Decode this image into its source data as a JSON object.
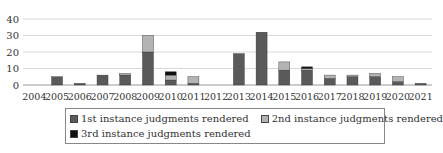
{
  "chart_data": {
    "type": "bar",
    "stacked": true,
    "title": "",
    "xlabel": "",
    "ylabel": "",
    "ylim": [
      0,
      40
    ],
    "yticks": [
      0,
      10,
      20,
      30,
      40
    ],
    "grid": true,
    "legend_position": "bottom",
    "categories": [
      "2004",
      "2005",
      "2006",
      "2007",
      "2008",
      "2009",
      "2010",
      "2011",
      "2012",
      "2013",
      "2014",
      "2015",
      "2016",
      "2017",
      "2018",
      "2019",
      "2020",
      "2021"
    ],
    "series": [
      {
        "name": "1st instance judgments rendered",
        "color": "#5a5a5a",
        "values": [
          0,
          5,
          1,
          6,
          6,
          20,
          3,
          1,
          0,
          19,
          32,
          9,
          9,
          4,
          5,
          5,
          2,
          1
        ]
      },
      {
        "name": "2nd instance judgments rendered",
        "color": "#b3b3b3",
        "values": [
          0,
          0,
          0,
          0,
          1,
          10,
          3,
          4,
          0,
          0,
          0,
          5,
          1,
          2,
          1,
          2,
          3,
          0
        ]
      },
      {
        "name": "3rd instance judgments rendered",
        "color": "#111111",
        "values": [
          0,
          0,
          0,
          0,
          0,
          0,
          2,
          0,
          0,
          0,
          0,
          0,
          1,
          0,
          0,
          0,
          0,
          0
        ]
      }
    ]
  },
  "legend": {
    "items": [
      {
        "label": "1st instance judgments rendered",
        "color": "#5a5a5a"
      },
      {
        "label": "2nd instance judgments rendered",
        "color": "#b3b3b3"
      },
      {
        "label": "3rd instance judgments rendered",
        "color": "#111111"
      }
    ]
  }
}
